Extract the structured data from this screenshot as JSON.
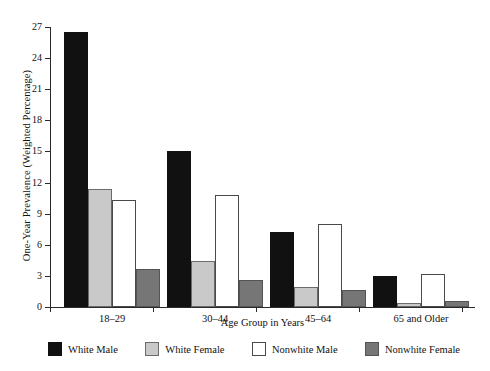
{
  "chart_data": {
    "type": "bar",
    "title": "",
    "xlabel": "Age Group in Years",
    "ylabel": "One-Year Prevalence (Weighted Percentage)",
    "categories": [
      "18–29",
      "30–44",
      "45–64",
      "65 and Older"
    ],
    "ylim": [
      0,
      27
    ],
    "yticks": [
      0,
      3,
      6,
      9,
      12,
      15,
      18,
      21,
      24,
      27
    ],
    "ytick_labels": [
      "0",
      "3",
      "6",
      "9",
      "12",
      "15",
      "18",
      "21",
      "24",
      "27"
    ],
    "grid": false,
    "legend_position": "bottom",
    "series": [
      {
        "name": "White Male",
        "color": "#111111",
        "border": "#111111",
        "values": [
          26.5,
          15.0,
          7.2,
          3.0
        ]
      },
      {
        "name": "White Female",
        "color": "#c9c9c9",
        "border": "#6b6b6b",
        "values": [
          11.4,
          4.4,
          1.9,
          0.4
        ]
      },
      {
        "name": "Nonwhite Male",
        "color": "#ffffff",
        "border": "#4a4a4a",
        "values": [
          10.3,
          10.8,
          8.0,
          3.2
        ]
      },
      {
        "name": "Nonwhite Female",
        "color": "#767676",
        "border": "#555555",
        "values": [
          3.7,
          2.6,
          1.6,
          0.6
        ]
      }
    ]
  },
  "axis": {
    "y_title": "One-Year Prevalence (Weighted Percentage)",
    "x_title": "Age Group in Years",
    "y_labels": [
      "27",
      "24",
      "21",
      "18",
      "15",
      "12",
      "9",
      "6",
      "3",
      "0"
    ],
    "x_labels": [
      "18–29",
      "30–44",
      "45–64",
      "65 and Older"
    ]
  },
  "legend": {
    "items": [
      {
        "label": "White Male"
      },
      {
        "label": "White Female"
      },
      {
        "label": "Nonwhite Male"
      },
      {
        "label": "Nonwhite Female"
      }
    ]
  }
}
